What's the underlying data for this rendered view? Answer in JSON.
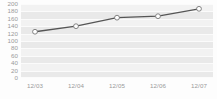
{
  "chart_data": {
    "type": "line",
    "title": "",
    "subtitle": "",
    "xlabel": "",
    "ylabel": "",
    "categories": [
      "12/03",
      "12/04",
      "12/05",
      "12/06",
      "12/07"
    ],
    "values": [
      125,
      140,
      163,
      167,
      187
    ],
    "series": [
      {
        "name": "",
        "values": [
          125,
          140,
          163,
          167,
          187
        ]
      }
    ],
    "ylim": [
      0,
      200
    ],
    "ytick_labels": [
      "200",
      "180",
      "160",
      "140",
      "120",
      "100",
      "80",
      "60",
      "40",
      "20",
      "0"
    ],
    "ytick_values": [
      200,
      180,
      160,
      140,
      120,
      100,
      80,
      60,
      40,
      20,
      0
    ],
    "ytick_step": 20,
    "grid": true,
    "grid_orientation": "horizontal",
    "legend": false,
    "legend_position": "none",
    "marker": "open-circle",
    "annotations": [],
    "colors": {
      "line": "#555555",
      "marker_fill": "#ffffff",
      "marker_stroke": "#777777",
      "plot_background": "#f2f2f2",
      "band": "#e9e9e9",
      "gridline": "#fbfbfb",
      "tick_label": "#9a9a9a",
      "page_background": "#fdfdfd"
    }
  }
}
